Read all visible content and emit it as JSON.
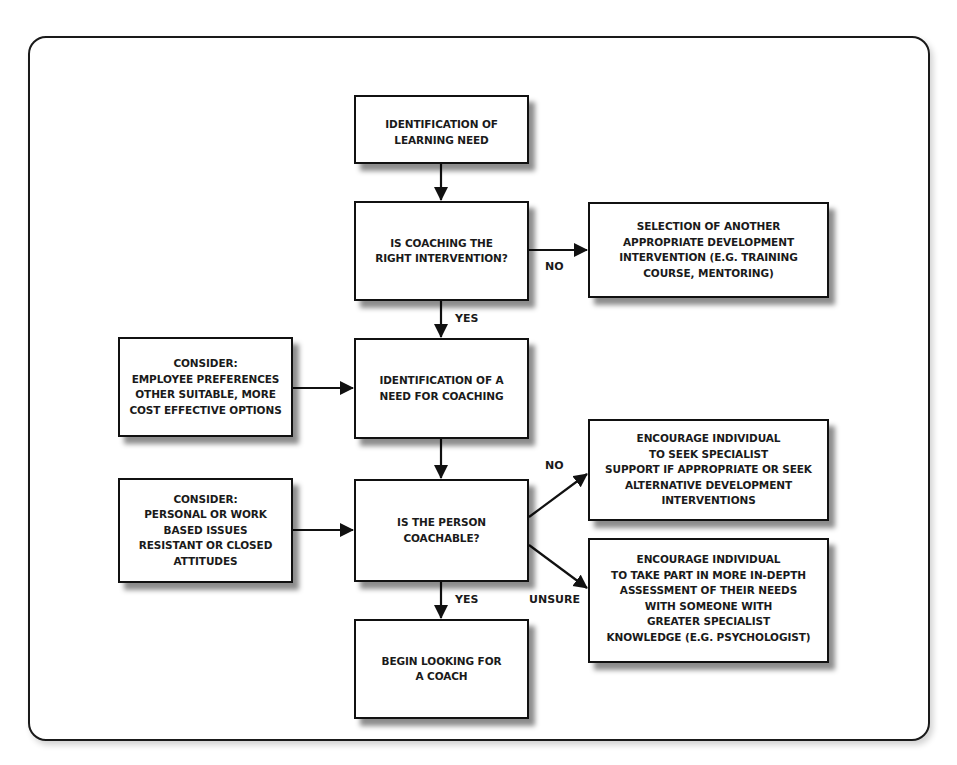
{
  "diagram": {
    "type": "flowchart",
    "nodes": {
      "learning_need": {
        "lines": [
          "IDENTIFICATION OF",
          "LEARNING NEED"
        ]
      },
      "right_intervention": {
        "lines": [
          "IS COACHING THE",
          "RIGHT INTERVENTION?"
        ]
      },
      "another_intervention": {
        "lines": [
          "SELECTION OF ANOTHER",
          "APPROPRIATE DEVELOPMENT",
          "INTERVENTION (E.G. TRAINING",
          "COURSE, MENTORING)"
        ]
      },
      "consider_preferences": {
        "lines": [
          "CONSIDER:",
          "EMPLOYEE PREFERENCES",
          "OTHER SUITABLE, MORE",
          "COST EFFECTIVE OPTIONS"
        ]
      },
      "need_for_coaching": {
        "lines": [
          "IDENTIFICATION OF A",
          "NEED FOR COACHING"
        ]
      },
      "seek_specialist": {
        "lines": [
          "ENCOURAGE INDIVIDUAL",
          "TO SEEK SPECIALIST",
          "SUPPORT IF APPROPRIATE OR SEEK",
          "ALTERNATIVE DEVELOPMENT",
          "INTERVENTIONS"
        ]
      },
      "consider_issues": {
        "lines": [
          "CONSIDER:",
          "PERSONAL OR WORK",
          "BASED ISSUES",
          "RESISTANT OR CLOSED",
          "ATTITUDES"
        ]
      },
      "coachable": {
        "lines": [
          "IS THE PERSON",
          "COACHABLE?"
        ]
      },
      "in_depth_assessment": {
        "lines": [
          "ENCOURAGE INDIVIDUAL",
          "TO TAKE PART IN MORE IN-DEPTH",
          "ASSESSMENT OF THEIR NEEDS",
          "WITH SOMEONE WITH",
          "GREATER SPECIALIST",
          "KNOWLEDGE (E.G. PSYCHOLOGIST)"
        ]
      },
      "begin_looking": {
        "lines": [
          "BEGIN LOOKING FOR",
          "A COACH"
        ]
      }
    },
    "edge_labels": {
      "right_intervention_no": "NO",
      "right_intervention_yes": "YES",
      "coachable_no": "NO",
      "coachable_unsure": "UNSURE",
      "coachable_yes": "YES"
    },
    "edges": [
      {
        "from": "learning_need",
        "to": "right_intervention",
        "label": ""
      },
      {
        "from": "right_intervention",
        "to": "another_intervention",
        "label": "NO"
      },
      {
        "from": "right_intervention",
        "to": "need_for_coaching",
        "label": "YES"
      },
      {
        "from": "consider_preferences",
        "to": "need_for_coaching",
        "label": ""
      },
      {
        "from": "need_for_coaching",
        "to": "coachable",
        "label": ""
      },
      {
        "from": "consider_issues",
        "to": "coachable",
        "label": ""
      },
      {
        "from": "coachable",
        "to": "seek_specialist",
        "label": "NO"
      },
      {
        "from": "coachable",
        "to": "in_depth_assessment",
        "label": "UNSURE"
      },
      {
        "from": "coachable",
        "to": "begin_looking",
        "label": "YES"
      }
    ],
    "colors": {
      "stroke": "#111111",
      "background": "#ffffff",
      "shadow": "#555555"
    }
  }
}
